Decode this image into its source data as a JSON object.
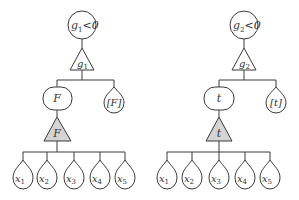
{
  "trees": [
    {
      "root": {
        "label_main": "g",
        "label_sub": "1",
        "label_rest": "<0"
      },
      "operator": {
        "label_main": "g",
        "label_sub": "1"
      },
      "mid": {
        "label": "F"
      },
      "side_leaf": {
        "label": "[F]"
      },
      "mid_operator": {
        "label": "F"
      },
      "leaves": [
        {
          "main": "x",
          "sub": "1"
        },
        {
          "main": "x",
          "sub": "2"
        },
        {
          "main": "x",
          "sub": "3"
        },
        {
          "main": "x",
          "sub": "4"
        },
        {
          "main": "x",
          "sub": "5"
        }
      ]
    },
    {
      "root": {
        "label_main": "g",
        "label_sub": "2",
        "label_rest": "<0"
      },
      "operator": {
        "label_main": "g",
        "label_sub": "2"
      },
      "mid": {
        "label": "t"
      },
      "side_leaf": {
        "label": "[t]"
      },
      "mid_operator": {
        "label": "t"
      },
      "leaves": [
        {
          "main": "x",
          "sub": "1"
        },
        {
          "main": "x",
          "sub": "2"
        },
        {
          "main": "x",
          "sub": "3"
        },
        {
          "main": "x",
          "sub": "4"
        },
        {
          "main": "x",
          "sub": "5"
        }
      ]
    }
  ],
  "colors": {
    "line": "#3a3a3a",
    "gray_fill": "#d4d4d4"
  }
}
